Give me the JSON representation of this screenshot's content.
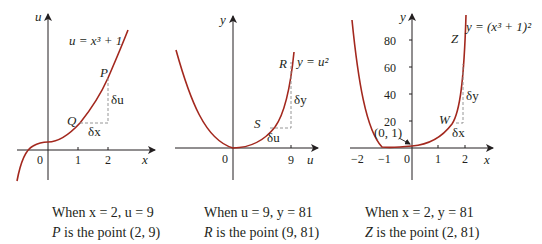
{
  "colors": {
    "curve": "#a3281e",
    "axis": "#231f20",
    "dash": "#8a8a8a",
    "background": "#ffffff"
  },
  "panels": [
    {
      "id": "panel-1",
      "x_axis_label": "x",
      "y_axis_label": "u",
      "equation": "u = x³ + 1",
      "origin_label": "0",
      "x_ticks": [
        "1",
        "2"
      ],
      "points": {
        "upper": "P",
        "lower": "Q"
      },
      "deltas": {
        "horizontal": "δx",
        "vertical": "δu"
      },
      "caption_line1": "When x = 2, u = 9",
      "caption_line2_point": "P",
      "caption_line2_text": " is the point (2, 9)"
    },
    {
      "id": "panel-2",
      "x_axis_label": "u",
      "y_axis_label": "y",
      "equation": "y = u²",
      "origin_label": "0",
      "x_ticks": [
        "9"
      ],
      "points": {
        "upper": "R",
        "lower": "S"
      },
      "deltas": {
        "horizontal": "δu",
        "vertical": "δy"
      },
      "caption_line1": "When u = 9, y = 81",
      "caption_line2_point": "R",
      "caption_line2_text": " is the point (9, 81)"
    },
    {
      "id": "panel-3",
      "x_axis_label": "x",
      "y_axis_label": "y",
      "equation": "y = (x³ + 1)²",
      "origin_label": "0",
      "x_ticks": [
        "−2",
        "−1",
        "1",
        "2"
      ],
      "y_ticks": [
        "20",
        "40",
        "60",
        "80"
      ],
      "annotation": "(0, 1)",
      "points": {
        "upper": "Z",
        "lower": "W"
      },
      "deltas": {
        "horizontal": "δx",
        "vertical": "δy"
      },
      "caption_line1": "When x = 2, y = 81",
      "caption_line2_point": "Z",
      "caption_line2_text": " is the point (2, 81)"
    }
  ]
}
